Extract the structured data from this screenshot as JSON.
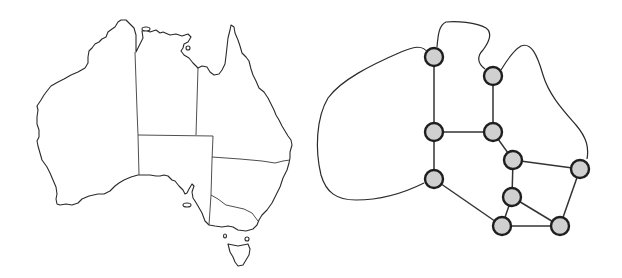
{
  "figure": {
    "left_panel": "Map of Australia with state and territory borders",
    "right_panel": "Constraint graph: regions as nodes, shared borders as edges"
  },
  "colors": {
    "line": "#2a2a2a",
    "node_fill": "#d0d0d0",
    "node_stroke": "#1e1e1e",
    "background": "#ffffff"
  },
  "graph": {
    "nodes": [
      {
        "id": "n1",
        "x": 123,
        "y": 57
      },
      {
        "id": "n2",
        "x": 182,
        "y": 76
      },
      {
        "id": "n3",
        "x": 123,
        "y": 132
      },
      {
        "id": "n4",
        "x": 182,
        "y": 132
      },
      {
        "id": "n5",
        "x": 202,
        "y": 160
      },
      {
        "id": "n6",
        "x": 269,
        "y": 169
      },
      {
        "id": "n7",
        "x": 201,
        "y": 197
      },
      {
        "id": "n8",
        "x": 123,
        "y": 179
      },
      {
        "id": "n9",
        "x": 191,
        "y": 226
      },
      {
        "id": "n10",
        "x": 249,
        "y": 226
      }
    ],
    "edges": [
      [
        "n1",
        "n3"
      ],
      [
        "n2",
        "n4"
      ],
      [
        "n3",
        "n4"
      ],
      [
        "n3",
        "n8"
      ],
      [
        "n4",
        "n5"
      ],
      [
        "n5",
        "n6"
      ],
      [
        "n5",
        "n7"
      ],
      [
        "n7",
        "n9"
      ],
      [
        "n7",
        "n10"
      ],
      [
        "n8",
        "n9"
      ],
      [
        "n9",
        "n10"
      ],
      [
        "n6",
        "n10"
      ]
    ],
    "node_radius": 9
  }
}
